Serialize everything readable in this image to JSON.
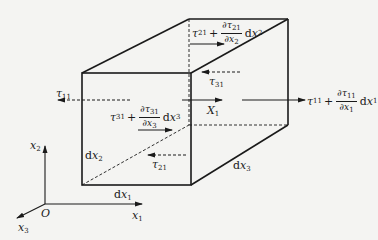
{
  "diagram": {
    "type": "stress-element-cube",
    "colors": {
      "line": "#1a1a1a",
      "background": "#f4f4f2"
    },
    "axes": {
      "origin_label": "O",
      "x1_label": "x",
      "x1_sub": "1",
      "x2_label": "x",
      "x2_sub": "2",
      "x3_label": "x",
      "x3_sub": "3"
    },
    "dimensions": {
      "dx1": {
        "d": "d",
        "var": "x",
        "sub": "1"
      },
      "dx2": {
        "d": "d",
        "var": "x",
        "sub": "2"
      },
      "dx3": {
        "d": "d",
        "var": "x",
        "sub": "3"
      }
    },
    "forces": {
      "tau11_left": {
        "sym": "τ",
        "sub": "11"
      },
      "tau11_right": {
        "sym": "τ",
        "sub": "11",
        "plus": "+",
        "num_d": "∂",
        "num_sym": "τ",
        "num_sub": "11",
        "den_d": "∂",
        "den_var": "x",
        "den_sub": "1",
        "d": "d",
        "var": "x",
        "var_sub": "1"
      },
      "tau21_bottom": {
        "sym": "τ",
        "sub": "21"
      },
      "tau21_top": {
        "sym": "τ",
        "sub": "21",
        "plus": "+",
        "num_d": "∂",
        "num_sym": "τ",
        "num_sub": "21",
        "den_d": "∂",
        "den_var": "x",
        "den_sub": "2",
        "d": "d",
        "var": "x",
        "var_sub": "2"
      },
      "tau31_back": {
        "sym": "τ",
        "sub": "31"
      },
      "tau31_front": {
        "sym": "τ",
        "sub": "31",
        "plus": "+",
        "num_d": "∂",
        "num_sym": "τ",
        "num_sub": "31",
        "den_d": "∂",
        "den_var": "x",
        "den_sub": "3",
        "d": "d",
        "var": "x",
        "var_sub": "3"
      },
      "body_force": {
        "sym": "X",
        "sub": "1"
      }
    }
  }
}
